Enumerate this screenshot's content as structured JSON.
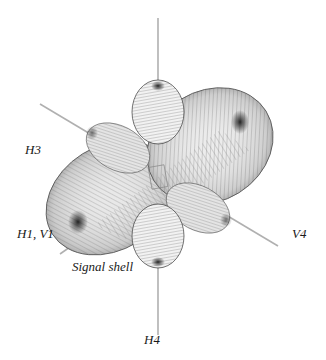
{
  "figure": {
    "labels": {
      "h3": "H3",
      "h1_v1": "H1, V1",
      "v4": "V4",
      "h4": "H4",
      "signal_shell": "Signal shell"
    },
    "colors": {
      "axis": "#b0b0b0",
      "mesh_dark": "#3a3a3a",
      "mesh_mid": "#777777",
      "shell_fill": "#9a9a9a",
      "background": "#ffffff"
    }
  }
}
